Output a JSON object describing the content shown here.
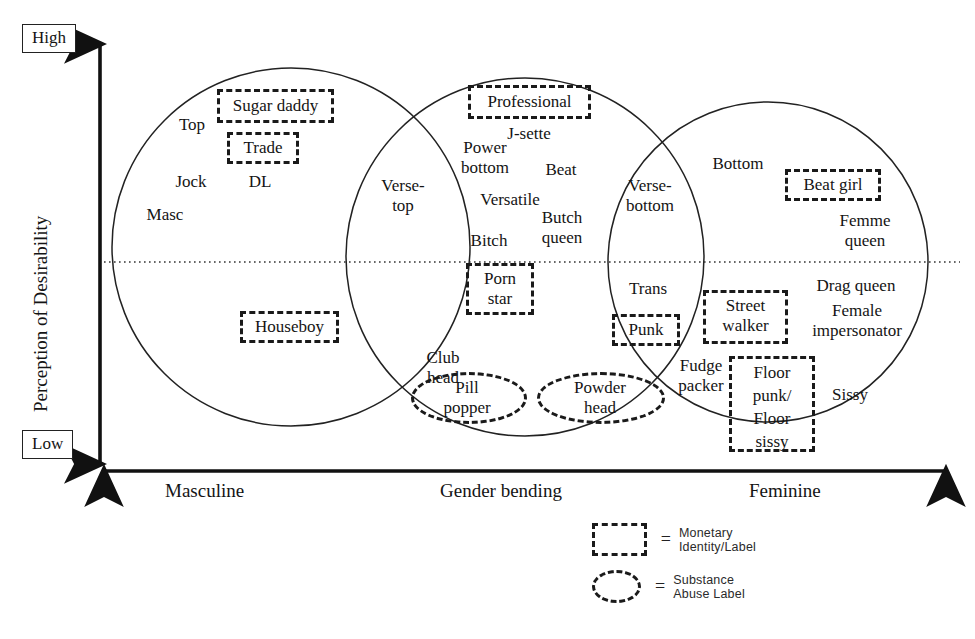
{
  "figure": {
    "type": "venn-diagram",
    "title": "",
    "y_axis": {
      "name": "Perception of Desirability",
      "high": "High",
      "low": "Low"
    },
    "x_axis": {
      "ticks": [
        "Masculine",
        "Gender bending",
        "Feminine"
      ]
    }
  },
  "circles": [
    {
      "name": "masculine-circle"
    },
    {
      "name": "gender-bending-circle"
    },
    {
      "name": "feminine-circle"
    }
  ],
  "labels": {
    "masc": "Masc",
    "top": "Top",
    "jock": "Jock",
    "dl": "DL",
    "sugar_daddy": "Sugar daddy",
    "trade": "Trade",
    "houseboy": "Houseboy",
    "verse_top": "Verse-\ntop",
    "professional": "Professional",
    "j_sette": "J-sette",
    "power_bottom": "Power\nbottom",
    "beat": "Beat",
    "versatile": "Versatile",
    "butch_queen": "Butch\nqueen",
    "bitch": "Bitch",
    "porn_star": "Porn\nstar",
    "club_head": "Club\nhead",
    "pill_popper": "Pill\npopper",
    "powder_head": "Powder\nhead",
    "verse_bottom": "Verse-\nbottom",
    "trans": "Trans",
    "punk": "Punk",
    "fudge_packer": "Fudge\npacker",
    "bottom": "Bottom",
    "beat_girl": "Beat girl",
    "femme_queen": "Femme\nqueen",
    "drag_queen": "Drag queen",
    "street_walker": "Street\nwalker",
    "female_impersonator": "Female\nimpersonator",
    "floor_punk_floor_sissy": "Floor\npunk/\nFloor\nsissy",
    "sissy": "Sissy"
  },
  "legend": {
    "equals": "=",
    "items": [
      {
        "key": "dashed-rectangle",
        "text": "Monetary Identity/Label"
      },
      {
        "key": "dashed-ellipse",
        "text": "Substance Abuse Label"
      }
    ]
  },
  "colors": {
    "ink": "#141414",
    "stroke": "#1a1a1a",
    "background": "#ffffff"
  }
}
